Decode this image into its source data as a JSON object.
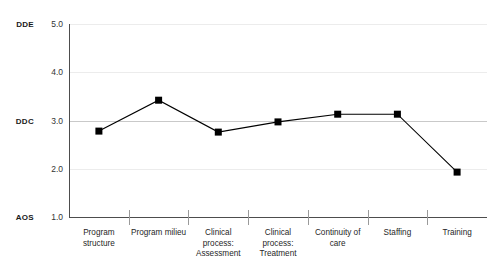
{
  "chart_data": {
    "type": "line",
    "title": "",
    "subtitle": "",
    "xlabel": "",
    "ylabel": "",
    "ylim": [
      1.0,
      5.0
    ],
    "grid": true,
    "legend": "none",
    "categories": [
      "Program structure",
      "Program milieu",
      "Clinical process: Assessment",
      "Clinical process: Treatment",
      "Continuity of care",
      "Staffing",
      "Training"
    ],
    "series": [
      {
        "name": "Mean rating",
        "marker": "square",
        "color": "#000000",
        "values": [
          2.78,
          3.42,
          2.76,
          2.97,
          3.13,
          3.13,
          1.93
        ]
      }
    ],
    "y_ticks": [
      {
        "value": 1.0,
        "label": "1.0",
        "anchor": "AOS"
      },
      {
        "value": 2.0,
        "label": "2.0",
        "anchor": ""
      },
      {
        "value": 3.0,
        "label": "3.0",
        "anchor": "DDC"
      },
      {
        "value": 4.0,
        "label": "4.0",
        "anchor": ""
      },
      {
        "value": 5.0,
        "label": "5.0",
        "anchor": "DDE"
      }
    ],
    "annotations": []
  }
}
